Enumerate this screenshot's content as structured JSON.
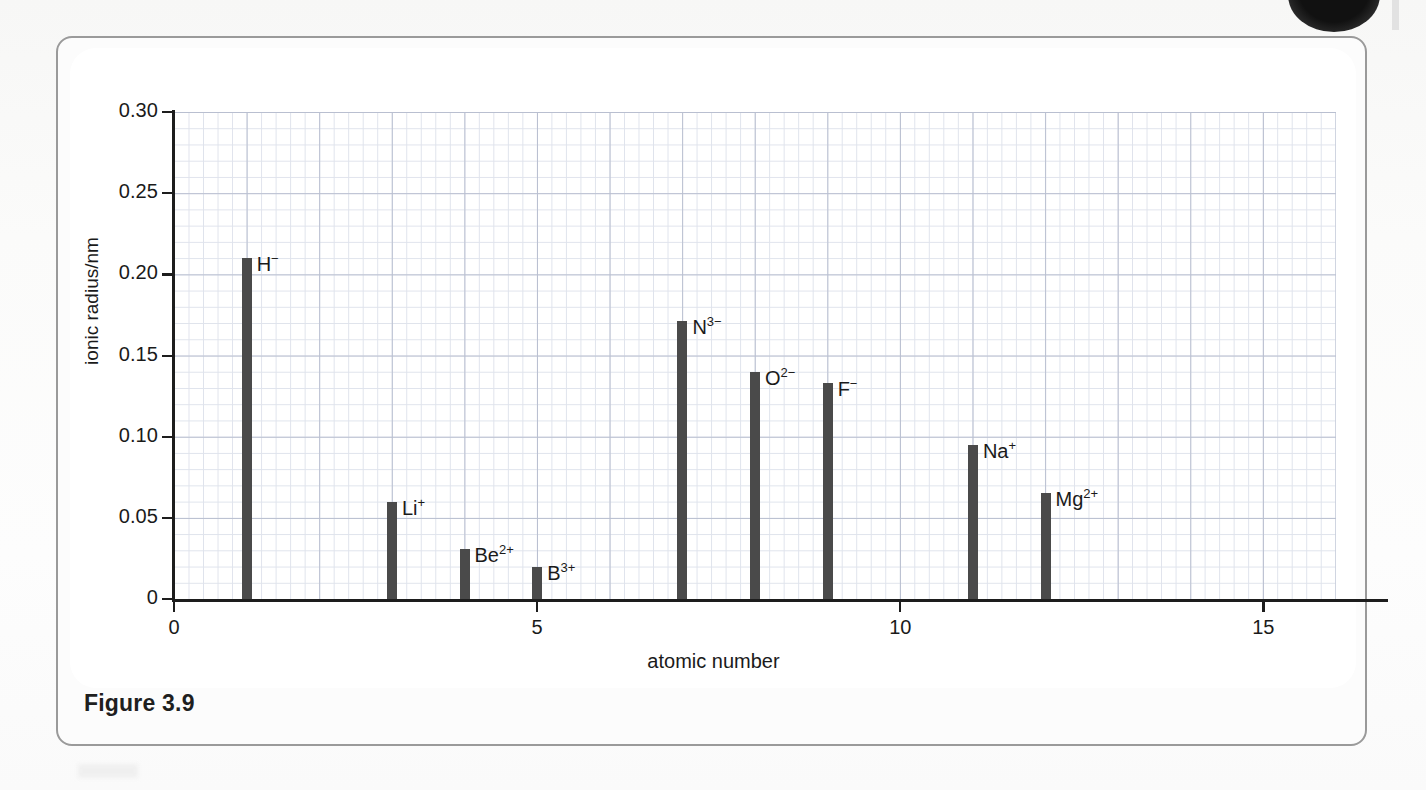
{
  "figure": {
    "caption": "Figure 3.9"
  },
  "chart_data": {
    "type": "bar",
    "title": "",
    "xlabel": "atomic number",
    "ylabel": "ionic radius/nm",
    "xlim": [
      0,
      16
    ],
    "ylim": [
      0,
      0.3
    ],
    "grid": true,
    "legend_position": "none",
    "x_ticks": [
      "0",
      "5",
      "10",
      "15"
    ],
    "x_tick_values": [
      0,
      5,
      10,
      15
    ],
    "y_ticks": [
      "0",
      "0.05",
      "0.10",
      "0.15",
      "0.20",
      "0.25",
      "0.30"
    ],
    "y_tick_values": [
      0,
      0.05,
      0.1,
      0.15,
      0.2,
      0.25,
      0.3
    ],
    "categories": [
      1,
      3,
      4,
      5,
      7,
      8,
      9,
      11,
      12
    ],
    "values": [
      0.21,
      0.06,
      0.031,
      0.02,
      0.171,
      0.14,
      0.133,
      0.095,
      0.065
    ],
    "points": [
      {
        "atomic_number": 1,
        "value": 0.21,
        "label": "H",
        "charge": "−"
      },
      {
        "atomic_number": 3,
        "value": 0.06,
        "label": "Li",
        "charge": "+"
      },
      {
        "atomic_number": 4,
        "value": 0.031,
        "label": "Be",
        "charge": "2+"
      },
      {
        "atomic_number": 5,
        "value": 0.02,
        "label": "B",
        "charge": "3+"
      },
      {
        "atomic_number": 7,
        "value": 0.171,
        "label": "N",
        "charge": "3−"
      },
      {
        "atomic_number": 8,
        "value": 0.14,
        "label": "O",
        "charge": "2−"
      },
      {
        "atomic_number": 9,
        "value": 0.133,
        "label": "F",
        "charge": "−"
      },
      {
        "atomic_number": 11,
        "value": 0.095,
        "label": "Na",
        "charge": "+"
      },
      {
        "atomic_number": 12,
        "value": 0.065,
        "label": "Mg",
        "charge": "2+"
      }
    ],
    "bar_color": "#4a4a4a",
    "grid_major_color": "#b9bfd0",
    "grid_minor_color": "#dfe3ec",
    "axis_color": "#1d1d1d"
  }
}
